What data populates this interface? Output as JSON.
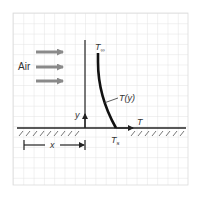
{
  "diagram": {
    "labels": {
      "air": "Air",
      "t_inf": "T",
      "t_inf_sub": "∞",
      "t_y": "T(y)",
      "y_axis": "y",
      "t_axis": "T",
      "t_s": "T",
      "t_s_sub": "s",
      "x_dim": "x"
    },
    "elements": [
      {
        "id": "flow-arrows",
        "count": 3,
        "color": "#8a8a8a"
      },
      {
        "id": "y-axis",
        "label": "y"
      },
      {
        "id": "t-axis",
        "label": "T"
      },
      {
        "id": "temperature-profile",
        "label": "T(y)",
        "from": "T∞",
        "to": "Ts"
      },
      {
        "id": "plate-surface",
        "hatched": true
      },
      {
        "id": "x-dimension",
        "label": "x"
      }
    ],
    "colors": {
      "grid": "#dcdcdc",
      "line": "#222222",
      "arrow_gray": "#8a8a8a",
      "background": "#ffffff"
    }
  }
}
